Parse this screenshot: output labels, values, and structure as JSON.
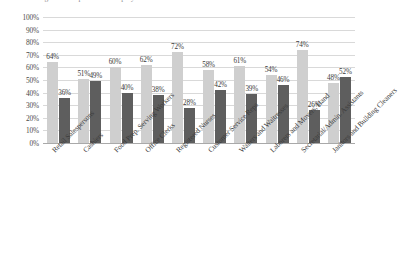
{
  "chart_data": {
    "type": "bar",
    "title": "",
    "xlabel": "",
    "ylabel": "",
    "ylim": [
      0,
      100
    ],
    "ytick_labels": [
      "100%",
      "90%",
      "80%",
      "70%",
      "60%",
      "50%",
      "40%",
      "30%",
      "20%",
      "10%",
      "0%"
    ],
    "ytick_values": [
      100,
      90,
      80,
      70,
      60,
      50,
      40,
      30,
      20,
      10,
      0
    ],
    "grid": true,
    "legend_position": "none",
    "value_suffix": "%",
    "categories": [
      "Retail Salespersons",
      "Cashiers",
      "Food Prep. Serving Workers",
      "Office Clerks",
      "Registered Nurses",
      "Customer Service Reps",
      "Waiters and Waitresses",
      "Laborers and Movers, Hand",
      "Secretarial/Admin. Assistants",
      "Janitors and Building Cleaners"
    ],
    "series": [
      {
        "name": "Series 1",
        "color": "#cfcfcf",
        "values": [
          64,
          51,
          60,
          62,
          72,
          58,
          61,
          54,
          74,
          48
        ],
        "labels": [
          "64%",
          "51%",
          "60%",
          "62%",
          "72%",
          "58%",
          "61%",
          "54%",
          "74%",
          "48%"
        ]
      },
      {
        "name": "Series 2",
        "color": "#5e5e5e",
        "values": [
          36,
          49,
          40,
          38,
          28,
          42,
          39,
          46,
          26,
          52
        ],
        "labels": [
          "36%",
          "49%",
          "40%",
          "38%",
          "28%",
          "42%",
          "39%",
          "46%",
          "26%",
          "52%"
        ]
      }
    ]
  },
  "colors": {
    "series_light": "#cfcfcf",
    "series_dark": "#5e5e5e",
    "gridline": "#d9d9d9",
    "axis": "#a9a9a9",
    "text": "#3a3a3a",
    "background": "#ffffff"
  },
  "title_strip": {
    "cropped_text": "Percentage of Occupational Group by Gender"
  }
}
